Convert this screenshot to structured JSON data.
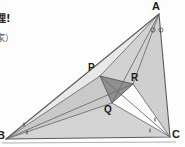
{
  "figure": {
    "name": "morley-trisector-triangle",
    "width": 185,
    "height": 147,
    "background_color": "#fdfdfd"
  },
  "caption": {
    "line1": "理!",
    "line2": "家）"
  },
  "labels": {
    "A": "A",
    "B": "B",
    "C": "C",
    "P": "P",
    "Q": "Q",
    "R": "R"
  },
  "colors": {
    "outline": "#6b6b6b",
    "fill_light": "#d9d9d9",
    "fill_mid": "#c4c4c4",
    "fill_pale": "#e6e6e6",
    "fill_dark": "#8f8f8f",
    "fill_white": "#fbfbfb",
    "label_text": "#1c1c1c",
    "caption_text": "#262626"
  },
  "geometry": {
    "vertices": {
      "A": [
        159,
        14
      ],
      "B": [
        6,
        139
      ],
      "C": [
        170,
        137
      ],
      "P": [
        100,
        76
      ],
      "Q": [
        112,
        103
      ],
      "R": [
        133,
        84
      ]
    },
    "angle_marks": {
      "A": "two-small-circles",
      "B": "two-small-ticks",
      "C": "two-small-ticks"
    },
    "regions": [
      {
        "name": "triangle-A-P-R",
        "points": "159,14 100,76 133,84",
        "fill": "fill_light"
      },
      {
        "name": "triangle-P-Q-R",
        "points": "100,76 112,103 133,84",
        "fill": "fill_dark"
      },
      {
        "name": "triangle-B-P-Q",
        "points": "6,139 100,76 112,103",
        "fill": "fill_mid"
      },
      {
        "name": "triangle-B-Q-C",
        "points": "6,139 112,103 170,137",
        "fill": "fill_light"
      },
      {
        "name": "triangle-C-R-A",
        "points": "170,137 133,84 159,14",
        "fill": "fill_light"
      },
      {
        "name": "triangle-Q-R-C",
        "points": "112,103 133,84 170,137",
        "fill": "fill_white"
      },
      {
        "name": "triangle-B-A-P",
        "points": "6,139 159,14 100,76",
        "fill": "fill_pale"
      }
    ],
    "cevians": [
      {
        "name": "cevian-A-to-Q",
        "from": "A",
        "to": "Q"
      },
      {
        "name": "cevian-A-to-P",
        "from": "A",
        "to": "P"
      },
      {
        "name": "cevian-A-to-R",
        "from": "A",
        "to": "R"
      },
      {
        "name": "cevian-B-to-P",
        "from": "B",
        "to": "P"
      },
      {
        "name": "cevian-B-to-Q",
        "from": "B",
        "to": "Q"
      },
      {
        "name": "cevian-B-to-R",
        "from": "B",
        "to": "R"
      },
      {
        "name": "cevian-C-to-Q",
        "from": "C",
        "to": "Q"
      },
      {
        "name": "cevian-C-to-R",
        "from": "C",
        "to": "R"
      },
      {
        "name": "cevian-C-to-P",
        "from": "C",
        "to": "P"
      }
    ]
  }
}
